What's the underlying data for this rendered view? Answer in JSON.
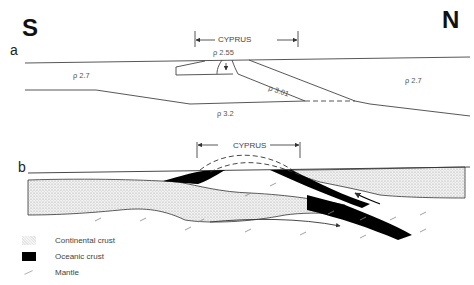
{
  "compass": {
    "south": "S",
    "north": "N"
  },
  "panels": {
    "a": {
      "label": "a",
      "region_label": "CYPRUS",
      "densities": [
        {
          "id": "south-crust",
          "text": "ρ 2.7"
        },
        {
          "id": "cyprus-block",
          "text": "ρ 2.55"
        },
        {
          "id": "slab",
          "text": "ρ 3.01"
        },
        {
          "id": "north-crust",
          "text": "ρ 2.7"
        },
        {
          "id": "mantle",
          "text": "ρ 3.2"
        }
      ]
    },
    "b": {
      "label": "b",
      "region_label": "CYPRUS"
    }
  },
  "legend": {
    "items": [
      {
        "key": "continental",
        "label": "Continental crust"
      },
      {
        "key": "oceanic",
        "label": "Oceanic crust"
      },
      {
        "key": "mantle",
        "label": "Mantle"
      }
    ]
  },
  "colors": {
    "line": "#333333",
    "oceanic": "#000000",
    "continental": "#e8e8e8"
  }
}
